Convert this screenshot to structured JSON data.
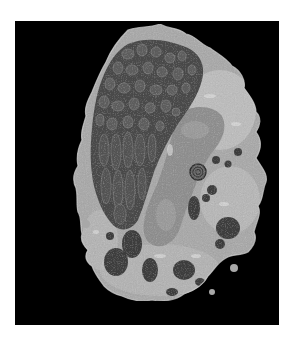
{
  "image": {
    "kind": "electron micrograph",
    "subject": "cell",
    "background_color": "#ffffff",
    "frame_color": "#000000",
    "frame": {
      "x": 15,
      "y": 21,
      "width": 264,
      "height": 304
    }
  },
  "colors": {
    "cytoplasm": "#a9a9a9",
    "cytoplasm_light": "#c8c8c8",
    "granule_region": "#4a4a4a",
    "granule": "#5c5c5c",
    "granule_edge": "#7a7a7a",
    "nucleus": "#8d8d8d",
    "dark_granule": "#3e3e3e"
  }
}
